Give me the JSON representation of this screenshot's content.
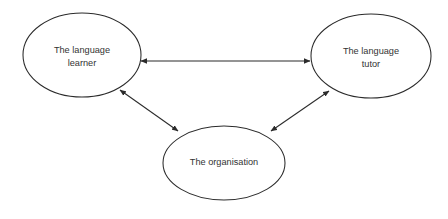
{
  "diagram": {
    "type": "node-link-diagram",
    "background_color": "#ffffff",
    "stroke_color": "#2b2b2b",
    "text_color": "#333333",
    "nodes": [
      {
        "id": "language-learner",
        "label_lines": [
          "The language",
          "learner"
        ],
        "line1": "The language",
        "line2": "learner",
        "shape": "ellipse",
        "cx": 82,
        "cy": 55,
        "rx": 59,
        "ry": 42
      },
      {
        "id": "language-tutor",
        "label_lines": [
          "The language",
          "tutor"
        ],
        "line1": "The language",
        "line2": "tutor",
        "shape": "ellipse",
        "cx": 371,
        "cy": 56,
        "rx": 60,
        "ry": 42
      },
      {
        "id": "organisation",
        "label_lines": [
          "The organisation"
        ],
        "line1": "The organisation",
        "shape": "ellipse",
        "cx": 224,
        "cy": 163,
        "rx": 61,
        "ry": 37
      }
    ],
    "edges": [
      {
        "id": "learner-tutor",
        "from": "language-learner",
        "to": "language-tutor",
        "arrowheads": "both",
        "x1": 141,
        "y1": 61,
        "x2": 310,
        "y2": 61
      },
      {
        "id": "learner-organisation",
        "from": "language-learner",
        "to": "organisation",
        "arrowheads": "both",
        "x1": 120,
        "y1": 90,
        "x2": 178,
        "y2": 131
      },
      {
        "id": "organisation-tutor",
        "from": "organisation",
        "to": "language-tutor",
        "arrowheads": "both",
        "x1": 271,
        "y1": 131,
        "x2": 329,
        "y2": 91
      }
    ]
  }
}
